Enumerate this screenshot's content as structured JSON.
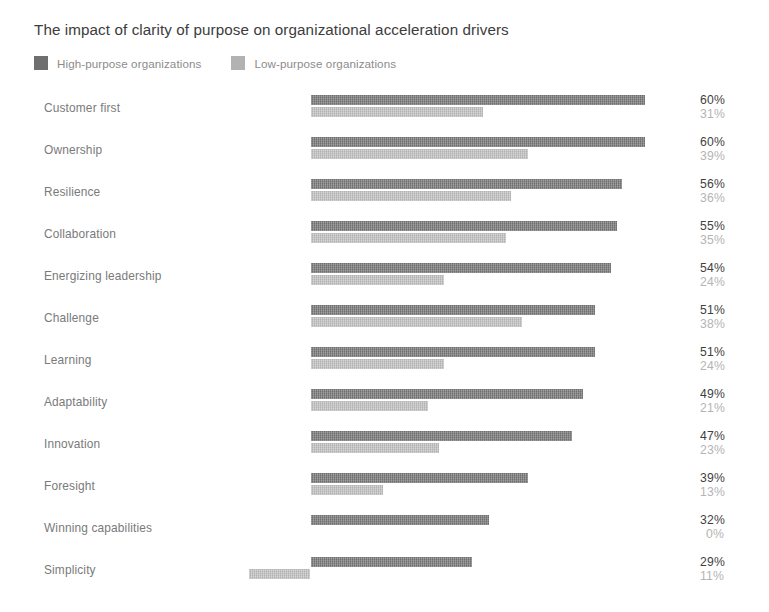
{
  "chart_data": {
    "type": "bar",
    "orientation": "horizontal",
    "title": "The impact of clarity of purpose on organizational acceleration drivers",
    "subtitle": "",
    "xlabel": "",
    "ylabel": "",
    "grid": false,
    "legend_position": "top-left",
    "value_suffix": "%",
    "xlim": [
      0,
      60
    ],
    "categories": [
      "Customer first",
      "Ownership",
      "Resilience",
      "Collaboration",
      "Energizing leadership",
      "Challenge",
      "Learning",
      "Adaptability",
      "Innovation",
      "Foresight",
      "Winning capabilities",
      "Simplicity"
    ],
    "series": [
      {
        "name": "High-purpose organizations",
        "color": "#6f6f6f",
        "values": [
          60,
          60,
          56,
          55,
          54,
          51,
          51,
          49,
          47,
          39,
          32,
          29
        ],
        "labels": [
          "60%",
          "60%",
          "56%",
          "55%",
          "54%",
          "51%",
          "51%",
          "49%",
          "47%",
          "39%",
          "32%",
          "29%"
        ]
      },
      {
        "name": "Low-purpose organizations",
        "color": "#b2b2b2",
        "values": [
          31,
          39,
          36,
          35,
          24,
          38,
          24,
          21,
          23,
          13,
          0,
          11
        ],
        "labels": [
          "31%",
          "39%",
          "36%",
          "35%",
          "24%",
          "38%",
          "24%",
          "21%",
          "23%",
          "13%",
          "0%",
          "11%"
        ]
      }
    ]
  },
  "legend": {
    "items": [
      {
        "label": "High-purpose organizations",
        "color": "#6f6f6f"
      },
      {
        "label": "Low-purpose organizations",
        "color": "#b2b2b2"
      }
    ]
  },
  "colors": {
    "high_purpose": "#6f6f6f",
    "low_purpose": "#b2b2b2",
    "title_text": "#3c3c3c",
    "category_text": "#7a7a7a",
    "value_high_text": "#3f3f3f",
    "value_low_text": "#b4b4b4",
    "background": "#ffffff"
  }
}
